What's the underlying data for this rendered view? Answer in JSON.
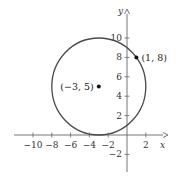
{
  "chart_data": {
    "type": "scatter",
    "title": "",
    "xlabel": "x",
    "ylabel": "y",
    "xlim": [
      -11,
      3.5
    ],
    "ylim": [
      -3.5,
      12
    ],
    "grid": false,
    "x_ticks": [
      -10,
      -8,
      -6,
      -4,
      -2,
      2
    ],
    "y_ticks": [
      -2,
      2,
      4,
      6,
      8,
      10
    ],
    "x_tick_labels": [
      "−10",
      "−8",
      "−6",
      "−4",
      "−2",
      "2"
    ],
    "y_tick_labels": [
      "−2",
      "2",
      "4",
      "6",
      "8",
      "10"
    ],
    "circle": {
      "center": [
        -3,
        5
      ],
      "radius": 5
    },
    "points": [
      {
        "x": -3,
        "y": 5,
        "label": "(−3, 5)"
      },
      {
        "x": 1,
        "y": 8,
        "label": "(1, 8)"
      }
    ],
    "colors": {
      "circle": "#4a4a4a",
      "axes": "#666666",
      "points": "#111111"
    }
  }
}
